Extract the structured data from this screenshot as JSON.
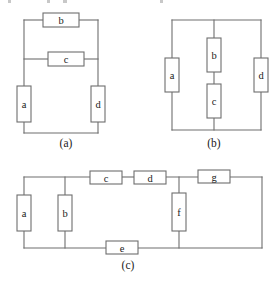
{
  "figure": {
    "colors": {
      "background": "#ffffff",
      "wire": "#6e6e6e",
      "box_fill": "#ffffff",
      "box_stroke": "#6e6e6e",
      "text": "#1a1a1a"
    },
    "panels": [
      {
        "id": "a",
        "caption": "(a)",
        "caption_x": 66,
        "caption_y": 143,
        "elements": [
          {
            "label": "b",
            "orientation": "horizontal",
            "x": 43,
            "y": 13,
            "w": 36,
            "h": 14
          },
          {
            "label": "c",
            "orientation": "horizontal",
            "x": 48,
            "y": 52,
            "w": 36,
            "h": 14
          },
          {
            "label": "a",
            "orientation": "vertical",
            "x": 17,
            "y": 86,
            "w": 14,
            "h": 36
          },
          {
            "label": "d",
            "orientation": "vertical",
            "x": 91,
            "y": 86,
            "w": 14,
            "h": 36
          }
        ],
        "wires": [
          "M24,20 L43,20",
          "M79,20 L98,20",
          "M24,20 L24,86",
          "M98,20 L98,86",
          "M24,59 L48,59",
          "M84,59 L98,59",
          "M24,122 L24,133",
          "M98,122 L98,133",
          "M24,133 L98,133"
        ]
      },
      {
        "id": "b",
        "caption": "(b)",
        "caption_x": 214,
        "caption_y": 143,
        "elements": [
          {
            "label": "a",
            "orientation": "vertical",
            "x": 165,
            "y": 58,
            "w": 14,
            "h": 34
          },
          {
            "label": "b",
            "orientation": "vertical",
            "x": 207,
            "y": 38,
            "w": 14,
            "h": 34
          },
          {
            "label": "c",
            "orientation": "vertical",
            "x": 207,
            "y": 84,
            "w": 14,
            "h": 34
          },
          {
            "label": "d",
            "orientation": "vertical",
            "x": 254,
            "y": 58,
            "w": 14,
            "h": 34
          }
        ],
        "wires": [
          "M172,20 L261,20",
          "M172,20 L172,58",
          "M172,92 L172,130",
          "M214,20 L214,38",
          "M214,72 L214,84",
          "M214,118 L214,130",
          "M261,20 L261,58",
          "M261,92 L261,130",
          "M172,130 L261,130"
        ]
      },
      {
        "id": "c",
        "caption": "(c)",
        "caption_x": 128,
        "caption_y": 265,
        "elements": [
          {
            "label": "a",
            "orientation": "vertical",
            "x": 17,
            "y": 195,
            "w": 14,
            "h": 36
          },
          {
            "label": "b",
            "orientation": "vertical",
            "x": 58,
            "y": 195,
            "w": 14,
            "h": 36
          },
          {
            "label": "c",
            "orientation": "horizontal",
            "x": 90,
            "y": 171,
            "w": 32,
            "h": 13
          },
          {
            "label": "d",
            "orientation": "horizontal",
            "x": 134,
            "y": 171,
            "w": 32,
            "h": 13
          },
          {
            "label": "e",
            "orientation": "horizontal",
            "x": 106,
            "y": 241,
            "w": 32,
            "h": 13
          },
          {
            "label": "f",
            "orientation": "vertical",
            "x": 172,
            "y": 193,
            "w": 14,
            "h": 38
          },
          {
            "label": "g",
            "orientation": "horizontal",
            "x": 198,
            "y": 170,
            "w": 32,
            "h": 13
          }
        ],
        "wires": [
          "M24,177 L90,177",
          "M122,177 L134,177",
          "M166,177 L198,177",
          "M230,177 L262,177",
          "M24,177 L24,195",
          "M65,177 L65,195",
          "M179,177 L179,193",
          "M262,177 L262,248",
          "M24,231 L24,248",
          "M65,231 L65,248",
          "M179,231 L179,248",
          "M24,248 L106,248",
          "M138,248 L262,248"
        ]
      }
    ],
    "top_artifacts": [
      {
        "x": 8,
        "y": 0,
        "w": 3,
        "h": 3
      },
      {
        "x": 47,
        "y": 0,
        "w": 3,
        "h": 3
      },
      {
        "x": 63,
        "y": 0,
        "w": 4,
        "h": 3
      },
      {
        "x": 160,
        "y": 0,
        "w": 3,
        "h": 3
      }
    ]
  }
}
